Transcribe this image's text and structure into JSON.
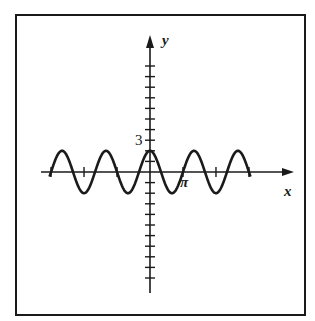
{
  "chart_data": {
    "type": "line",
    "title": "",
    "xlabel": "x",
    "ylabel": "y",
    "function": "y = 2cos(3x/2)",
    "amplitude": 2,
    "period": "4π/3",
    "x_range": [
      "-3π",
      "3π"
    ],
    "xlim": [
      -9.42,
      9.42
    ],
    "ylim": [
      -10,
      10
    ],
    "x_ticks": [
      -9.4248,
      -6.2832,
      -3.1416,
      3.1416,
      6.2832,
      9.4248
    ],
    "x_tick_labels": [
      {
        "value": 3.1416,
        "label": "π"
      }
    ],
    "y_ticks": [
      -10,
      -9,
      -8,
      -7,
      -6,
      -5,
      -4,
      -3,
      -2,
      -1,
      1,
      2,
      3,
      4,
      5,
      6,
      7,
      8,
      9,
      10
    ],
    "y_tick_labels": [
      {
        "value": 3,
        "label": "3"
      }
    ],
    "series": [
      {
        "name": "y = 2cos(3x/2)",
        "color": "#1a1a1a"
      }
    ],
    "grid": false,
    "legend": "none"
  },
  "colors": {
    "ink": "#1a1a1a",
    "background": "#ffffff"
  }
}
